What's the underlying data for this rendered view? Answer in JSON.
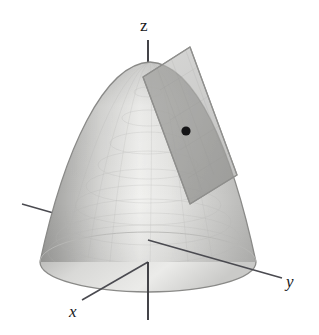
{
  "figure": {
    "background_color": "#ffffff",
    "width": 319,
    "height": 335
  },
  "axes": {
    "z": {
      "label": "z",
      "style": "upright",
      "color": "#3a3a3f",
      "from": [
        148,
        320
      ],
      "to": [
        148,
        40
      ]
    },
    "y": {
      "label": "y",
      "style": "italic",
      "color": "#4a4a50",
      "from": [
        22,
        204
      ],
      "to": [
        282,
        278
      ]
    },
    "x": {
      "label": "x",
      "style": "italic",
      "color": "#4a4a50",
      "from": [
        82,
        300
      ],
      "to": [
        232,
        216
      ]
    }
  },
  "surface": {
    "name": "paraboloid",
    "apex": [
      150,
      62
    ],
    "base_center": [
      148,
      262
    ],
    "base_radius_x": 108,
    "base_radius_y": 30,
    "fill_light": "#f2f2f1",
    "fill_mid": "#d2d2d0",
    "fill_dark": "#9d9d9c",
    "outline_color": "#8d8d8c"
  },
  "tangent_plane": {
    "name": "tangent-plane",
    "corners": [
      [
        190,
        47
      ],
      [
        237,
        175
      ],
      [
        190,
        204
      ],
      [
        143,
        77
      ]
    ],
    "fill": "#bcbcba",
    "opacity": 0.72,
    "outline_color": "#9a9a98"
  },
  "tangent_point": {
    "name": "tangent-point",
    "position": [
      186,
      131
    ],
    "radius": 4.5,
    "color": "#141416"
  },
  "colors": {
    "ink": "#17171a",
    "axis": "#45454a",
    "surface_light": "#f0f0ee",
    "surface_dark": "#9b9b99",
    "plane": "#bcbcba"
  }
}
